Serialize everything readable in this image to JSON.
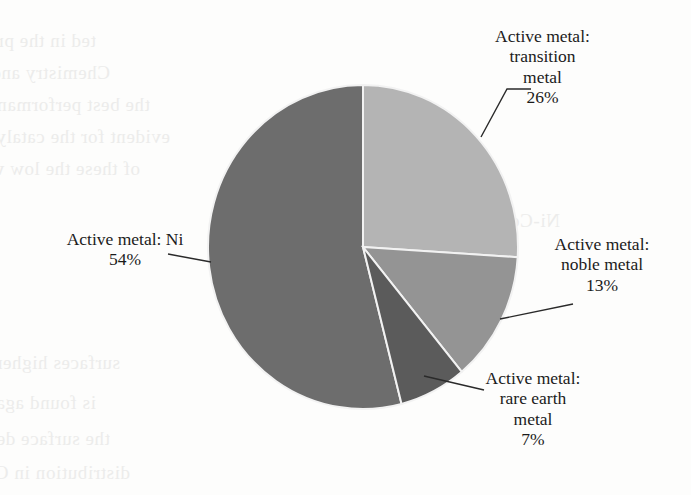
{
  "page": {
    "background_color": "#fdfdfc",
    "text_color": "#1b1b1b",
    "width": 691,
    "height": 495
  },
  "chart_data": {
    "type": "pie",
    "title": "",
    "subtitle": "",
    "xlabel": "",
    "ylabel": "",
    "legend_position": "none",
    "grid": false,
    "labels_outside": true,
    "start_angle_deg": 0,
    "direction": "clockwise",
    "categories": [
      "Active metal: transition metal",
      "Active metal: noble metal",
      "Active metal: rare earth metal",
      "Active metal: Ni"
    ],
    "values": [
      26,
      13,
      7,
      54
    ],
    "value_labels": [
      "26%",
      "13%",
      "7%",
      "54%"
    ],
    "unit": "%",
    "total": 100,
    "colors": [
      "#b4b4b4",
      "#949494",
      "#5b5b5b",
      "#6d6d6d"
    ],
    "slice_edge_color": "#f2f2f2",
    "slices": [
      {
        "name": "transition-metal-slice",
        "label_lines": [
          "Active metal:",
          "transition",
          "metal"
        ],
        "value_label": "26%",
        "value": 26,
        "color": "#b4b4b4",
        "label_position": "top-right"
      },
      {
        "name": "noble-metal-slice",
        "label_lines": [
          "Active metal:",
          "noble metal"
        ],
        "value_label": "13%",
        "value": 13,
        "color": "#949494",
        "label_position": "right"
      },
      {
        "name": "rare-earth-metal-slice",
        "label_lines": [
          "Active metal:",
          "rare earth",
          "metal"
        ],
        "value_label": "7%",
        "value": 7,
        "color": "#5b5b5b",
        "label_position": "bottom-right"
      },
      {
        "name": "ni-slice",
        "label_lines": [
          "Active metal: Ni"
        ],
        "value_label": "54%",
        "value": 54,
        "color": "#6d6d6d",
        "label_position": "left"
      }
    ]
  },
  "labels": {
    "transition": {
      "line1": "Active metal:",
      "line2": "transition",
      "line3": "metal",
      "value": "26%"
    },
    "noble": {
      "line1": "Active metal:",
      "line2": "noble metal",
      "value": "13%"
    },
    "rare_earth": {
      "line1": "Active metal:",
      "line2": "rare earth",
      "line3": "metal",
      "value": "7%"
    },
    "ni": {
      "line1": "Active metal: Ni",
      "value": "54%"
    }
  },
  "ghost_text": {
    "note": "faint show-through text from the reverse of the scanned book page",
    "lines": [
      "ted in the preparation of",
      "Chemistry and Catalysis",
      "the best performance",
      "evident for the catalyst",
      "of these the low water",
      "Ni-Co-O-Ce-O-Mn",
      "surfaces higher",
      "is found again in remov",
      "the surface dependence",
      "distribution in CaO"
    ]
  }
}
